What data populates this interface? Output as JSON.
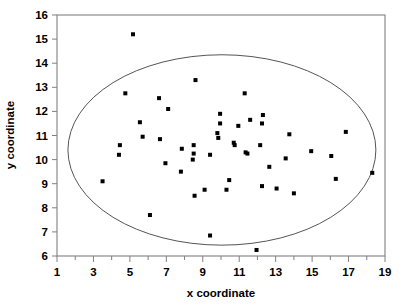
{
  "chart_data": {
    "type": "scatter",
    "title": "",
    "xlabel": "x coordinate",
    "ylabel": "y coordinate",
    "xlim": [
      1,
      19
    ],
    "ylim": [
      6,
      16
    ],
    "grid": false,
    "legend": null,
    "x_ticks": [
      1,
      3,
      5,
      7,
      9,
      11,
      13,
      15,
      17,
      19
    ],
    "x_tick_labels": [
      "1",
      "3",
      "5",
      "7",
      "9",
      "11",
      "13",
      "15",
      "17",
      "19"
    ],
    "x_minor_ticks": [
      2,
      4,
      6,
      8,
      10,
      12,
      14,
      16,
      18
    ],
    "y_ticks": [
      6,
      7,
      8,
      9,
      10,
      11,
      12,
      13,
      14,
      15,
      16
    ],
    "y_tick_labels": [
      "6",
      "7",
      "8",
      "9",
      "10",
      "11",
      "12",
      "13",
      "14",
      "15",
      "16"
    ],
    "points": [
      [
        5.17,
        15.2
      ],
      [
        8.6,
        13.3
      ],
      [
        4.75,
        12.75
      ],
      [
        11.3,
        12.75
      ],
      [
        6.6,
        12.55
      ],
      [
        7.1,
        12.1
      ],
      [
        9.95,
        11.9
      ],
      [
        12.3,
        11.85
      ],
      [
        11.6,
        11.65
      ],
      [
        5.55,
        11.55
      ],
      [
        12.25,
        11.5
      ],
      [
        9.95,
        11.5
      ],
      [
        10.95,
        11.4
      ],
      [
        16.85,
        11.15
      ],
      [
        13.75,
        11.05
      ],
      [
        9.8,
        11.1
      ],
      [
        5.7,
        10.95
      ],
      [
        6.65,
        10.85
      ],
      [
        9.85,
        10.9
      ],
      [
        10.7,
        10.7
      ],
      [
        10.75,
        10.6
      ],
      [
        12.15,
        10.6
      ],
      [
        4.45,
        10.6
      ],
      [
        8.5,
        10.6
      ],
      [
        7.85,
        10.45
      ],
      [
        14.95,
        10.35
      ],
      [
        11.35,
        10.3
      ],
      [
        11.45,
        10.25
      ],
      [
        8.5,
        10.25
      ],
      [
        4.4,
        10.2
      ],
      [
        9.4,
        10.2
      ],
      [
        16.05,
        10.15
      ],
      [
        13.55,
        10.05
      ],
      [
        8.45,
        10.0
      ],
      [
        6.95,
        9.85
      ],
      [
        12.65,
        9.7
      ],
      [
        7.8,
        9.5
      ],
      [
        18.3,
        9.45
      ],
      [
        16.3,
        9.2
      ],
      [
        10.45,
        9.15
      ],
      [
        3.5,
        9.1
      ],
      [
        12.25,
        8.9
      ],
      [
        13.05,
        8.8
      ],
      [
        9.1,
        8.75
      ],
      [
        10.3,
        8.75
      ],
      [
        14.0,
        8.6
      ],
      [
        8.55,
        8.5
      ],
      [
        6.1,
        7.7
      ],
      [
        9.4,
        6.85
      ],
      [
        11.95,
        6.25
      ]
    ],
    "ellipse": {
      "label": "tolerance-ellipse",
      "center_x": 10.05,
      "center_y": 10.4,
      "semi_axis_x": 8.45,
      "semi_axis_y": 3.95,
      "rotation_deg": 0
    },
    "marker": {
      "shape": "square",
      "color": "#000000",
      "size_px": 4
    }
  }
}
